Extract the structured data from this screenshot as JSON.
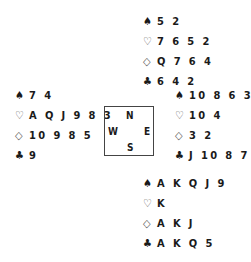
{
  "hands": {
    "north": {
      "spades": "5 2",
      "hearts": "7 6 5 2",
      "diamonds": "Q 7 6 4",
      "clubs": "6 4 2"
    },
    "west": {
      "spades": "7 4",
      "hearts": "A Q J 9 8 3",
      "diamonds": "10 9 8 5",
      "clubs": "9"
    },
    "east": {
      "spades": "10 8 6 3",
      "hearts": "10 4",
      "diamonds": "3 2",
      "clubs": "J 10 8 7 3"
    },
    "south": {
      "spades": "A K Q J 9",
      "hearts": "K",
      "diamonds": "A K J",
      "clubs": "A K Q 5"
    }
  },
  "suits": {
    "spades": "♠",
    "hearts": "♡",
    "diamonds": "◇",
    "clubs": "♣"
  },
  "compass": {
    "n": "N",
    "s": "S",
    "w": "W",
    "e": "E"
  }
}
